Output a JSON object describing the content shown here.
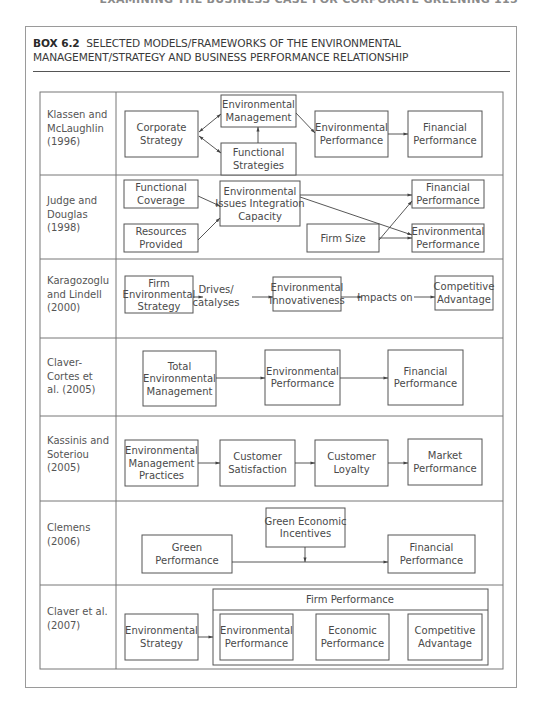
{
  "running_head": "EXAMINING THE BUSINESS CASE FOR CORPORATE GREENING   115",
  "box": {
    "number": "BOX 6.2",
    "title": "SELECTED MODELS/FRAMEWORKS OF THE ENVIRONMENTAL MANAGEMENT/STRATEGY AND BUSINESS PERFORMANCE RELATIONSHIP"
  },
  "colors": {
    "line": "#555555",
    "text": "#4a4a4a",
    "border": "#9a9a9a"
  },
  "rows": [
    {
      "author": [
        "Klassen and",
        "McLaughlin",
        "(1996)"
      ],
      "nodes": {
        "corporate_strategy": [
          "Corporate",
          "Strategy"
        ],
        "environmental_management": [
          "Environmental",
          "Management"
        ],
        "functional_strategies": [
          "Functional",
          "Strategies"
        ],
        "environmental_performance": [
          "Environmental",
          "Performance"
        ],
        "financial_performance": [
          "Financial",
          "Performance"
        ]
      }
    },
    {
      "author": [
        "Judge and",
        "Douglas",
        "(1998)"
      ],
      "nodes": {
        "functional_coverage": [
          "Functional",
          "Coverage"
        ],
        "resources_provided": [
          "Resources",
          "Provided"
        ],
        "integration_capacity": [
          "Environmental",
          "Issues Integration",
          "Capacity"
        ],
        "firm_size": [
          "Firm Size"
        ],
        "financial_performance": [
          "Financial",
          "Performance"
        ],
        "environmental_performance": [
          "Environmental",
          "Performance"
        ]
      }
    },
    {
      "author": [
        "Karagozoglu",
        "and Lindell",
        "(2000)"
      ],
      "nodes": {
        "firm_env_strategy": [
          "Firm",
          "Environmental",
          "Strategy"
        ],
        "env_innovativeness": [
          "Environmental",
          "Innovativeness"
        ],
        "competitive_advantage": [
          "Competitive",
          "Advantage"
        ]
      },
      "edge_labels": {
        "drives": [
          "Drives/",
          "catalyses"
        ],
        "impacts": "Impacts on"
      }
    },
    {
      "author": [
        "Claver-",
        "Cortes et",
        "al. (2005)"
      ],
      "nodes": {
        "tem": [
          "Total",
          "Environmental",
          "Management"
        ],
        "environmental_performance": [
          "Environmental",
          "Performance"
        ],
        "financial_performance": [
          "Financial",
          "Performance"
        ]
      }
    },
    {
      "author": [
        "Kassinis and",
        "Soteriou",
        "(2005)"
      ],
      "nodes": {
        "emp": [
          "Environmental",
          "Management",
          "Practices"
        ],
        "customer_satisfaction": [
          "Customer",
          "Satisfaction"
        ],
        "customer_loyalty": [
          "Customer",
          "Loyalty"
        ],
        "market_performance": [
          "Market",
          "Performance"
        ]
      }
    },
    {
      "author": [
        "Clemens",
        "(2006)"
      ],
      "nodes": {
        "green_performance": [
          "Green",
          "Performance"
        ],
        "green_incentives": [
          "Green Economic",
          "Incentives"
        ],
        "financial_performance": [
          "Financial",
          "Performance"
        ]
      }
    },
    {
      "author": [
        "Claver et al.",
        "(2007)"
      ],
      "nodes": {
        "environmental_strategy": [
          "Environmental",
          "Strategy"
        ],
        "firm_performance": "Firm Performance",
        "environmental_performance": [
          "Environmental",
          "Performance"
        ],
        "economic_performance": [
          "Economic",
          "Performance"
        ],
        "competitive_advantage": [
          "Competitive",
          "Advantage"
        ]
      }
    }
  ]
}
